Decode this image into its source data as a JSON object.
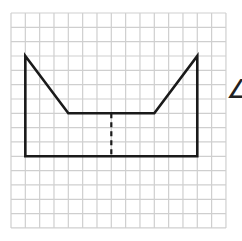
{
  "grid": {
    "origin_px": [
      11,
      13
    ],
    "cell_px": 14.33,
    "cols": 15,
    "rows": 15,
    "line_color": "#cfcfcf"
  },
  "shape": {
    "outline_points": [
      [
        1,
        3
      ],
      [
        4,
        7
      ],
      [
        10,
        7
      ],
      [
        13,
        3
      ],
      [
        13,
        10
      ],
      [
        1,
        10
      ]
    ],
    "stroke_color": "#1a1a1a",
    "stroke_width": 2.6
  },
  "dashed_segment": {
    "from": [
      7,
      7
    ],
    "to": [
      7,
      10
    ],
    "stroke_color": "#1a1a1a",
    "dash": "5,4"
  },
  "side_glyph": {
    "text": "∠"
  }
}
